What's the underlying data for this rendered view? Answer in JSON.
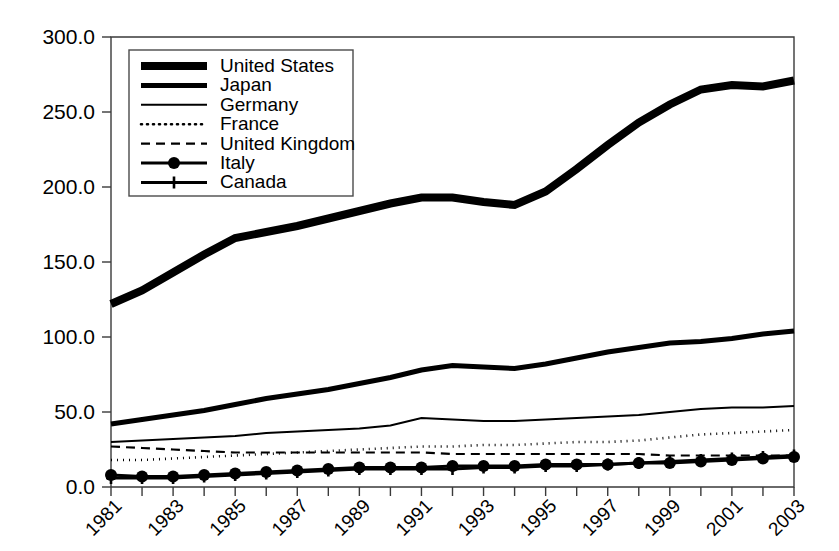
{
  "chart_data": {
    "type": "line",
    "title": "",
    "subtitle": "",
    "xlabel": "",
    "ylabel": "",
    "grid": false,
    "legend_position": "top-left-inside",
    "xlim": [
      1981,
      2003
    ],
    "ylim": [
      0.0,
      300.0
    ],
    "ytick_step": 50.0,
    "ytick_labels": [
      "0.0",
      "50.0",
      "100.0",
      "150.0",
      "200.0",
      "250.0",
      "300.0"
    ],
    "ytick_values": [
      0,
      50,
      100,
      150,
      200,
      250,
      300
    ],
    "xtick_values": [
      1981,
      1982,
      1983,
      1984,
      1985,
      1986,
      1987,
      1988,
      1989,
      1990,
      1991,
      1992,
      1993,
      1994,
      1995,
      1996,
      1997,
      1998,
      1999,
      2000,
      2001,
      2002,
      2003
    ],
    "xtick_labels_shown": [
      "1981",
      "1983",
      "1985",
      "1987",
      "1989",
      "1991",
      "1993",
      "1995",
      "1997",
      "1999",
      "2001",
      "2003"
    ],
    "x": [
      1981,
      1982,
      1983,
      1984,
      1985,
      1986,
      1987,
      1988,
      1989,
      1990,
      1991,
      1992,
      1993,
      1994,
      1995,
      1996,
      1997,
      1998,
      1999,
      2000,
      2001,
      2002,
      2003
    ],
    "series": [
      {
        "name": "United States",
        "style": "very-thick-solid",
        "stroke_width": 8,
        "dash": "none",
        "marker": "none",
        "values": [
          122,
          131,
          143,
          155,
          166,
          170,
          174,
          179,
          184,
          189,
          193,
          193,
          190,
          188,
          197,
          212,
          228,
          243,
          255,
          265,
          268,
          267,
          271
        ]
      },
      {
        "name": "Japan",
        "style": "thick-solid",
        "stroke_width": 5,
        "dash": "none",
        "marker": "none",
        "values": [
          42,
          45,
          48,
          51,
          55,
          59,
          62,
          65,
          69,
          73,
          78,
          81,
          80,
          79,
          82,
          86,
          90,
          93,
          96,
          97,
          99,
          102,
          104
        ]
      },
      {
        "name": "Germany",
        "style": "thin-solid",
        "stroke_width": 2,
        "dash": "none",
        "marker": "none",
        "values": [
          30,
          31,
          32,
          33,
          34,
          36,
          37,
          38,
          39,
          41,
          46,
          45,
          44,
          44,
          45,
          46,
          47,
          48,
          50,
          52,
          53,
          53,
          54
        ]
      },
      {
        "name": "France",
        "style": "dotted",
        "stroke_width": 2.6,
        "dash": "1,5",
        "marker": "none",
        "values": [
          18,
          18,
          19,
          20,
          21,
          22,
          23,
          24,
          25,
          26,
          27,
          27,
          28,
          28,
          29,
          30,
          30,
          31,
          33,
          35,
          36,
          37,
          38
        ]
      },
      {
        "name": "United Kingdom",
        "style": "dashed",
        "stroke_width": 2.2,
        "dash": "9,6",
        "marker": "none",
        "values": [
          27,
          26,
          25,
          24,
          23,
          23,
          23,
          23,
          23,
          23,
          23,
          22,
          22,
          22,
          22,
          22,
          22,
          22,
          21,
          21,
          21,
          21,
          21
        ]
      },
      {
        "name": "Italy",
        "style": "solid-circle-marker",
        "stroke_width": 3,
        "dash": "none",
        "marker": "circle",
        "values": [
          8,
          7,
          7,
          8,
          9,
          10,
          11,
          12,
          13,
          13,
          13,
          14,
          14,
          14,
          15,
          15,
          15,
          16,
          16,
          17,
          18,
          19,
          20
        ]
      },
      {
        "name": "Canada",
        "style": "solid-plus-marker",
        "stroke_width": 3,
        "dash": "none",
        "marker": "plus",
        "values": [
          6,
          6,
          6,
          7,
          8,
          9,
          10,
          11,
          12,
          12,
          12,
          12,
          13,
          13,
          14,
          14,
          15,
          16,
          17,
          18,
          19,
          20,
          21
        ]
      }
    ]
  },
  "legend": {
    "entries": [
      {
        "label": "United States"
      },
      {
        "label": "Japan"
      },
      {
        "label": "Germany"
      },
      {
        "label": "France"
      },
      {
        "label": "United Kingdom"
      },
      {
        "label": "Italy"
      },
      {
        "label": "Canada"
      }
    ]
  },
  "colors": {
    "ink": "#000000",
    "axis": "#3a3a3a",
    "background": "#ffffff",
    "legend_border": "#4a4a4a"
  }
}
